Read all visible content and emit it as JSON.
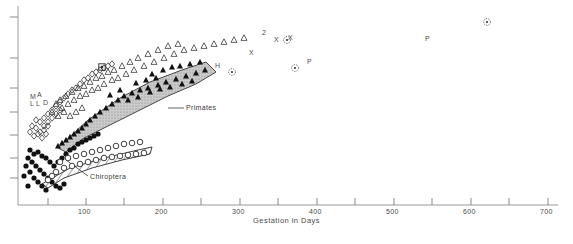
{
  "figure": {
    "type": "scatter",
    "background": "#ffffff",
    "axis_color": "#8a8a8a",
    "width": 573,
    "height": 244
  },
  "axes": {
    "x": {
      "label": "Gestation in Days",
      "min": 0,
      "max": 700,
      "plot_left_px": 18,
      "plot_right_px": 558,
      "major_ticks": [
        100,
        200,
        300,
        400,
        500,
        600,
        700
      ],
      "minor_ticks": [
        50,
        150,
        250,
        350,
        450,
        550,
        650
      ],
      "tick_labels": [
        "100",
        "200",
        "300",
        "400",
        "500",
        "600",
        "700"
      ],
      "scale": "linear",
      "grid": false
    },
    "y": {
      "label": "",
      "scale": "log",
      "tick_labels": [],
      "tick_px": [
        17,
        58,
        88,
        112,
        135,
        158,
        178
      ],
      "grid": false,
      "note": "unlabeled tick marks only"
    }
  },
  "annotations": {
    "primates": {
      "text": "Primates",
      "x_px": 186,
      "y_px": 108
    },
    "chiroptera": {
      "text": "Chiroptera",
      "x_px": 90,
      "y_px": 178
    },
    "cluster_letters": [
      {
        "text": "M",
        "x_px": 30,
        "y_px": 97
      },
      {
        "text": "A",
        "x_px": 37,
        "y_px": 95
      },
      {
        "text": "L",
        "x_px": 30,
        "y_px": 104
      },
      {
        "text": "L",
        "x_px": 36,
        "y_px": 104
      },
      {
        "text": "D",
        "x_px": 43,
        "y_px": 103
      }
    ],
    "outliers": [
      {
        "text": "H",
        "x_px": 215,
        "y_px": 66
      },
      {
        "text": "X",
        "x_px": 249,
        "y_px": 53
      },
      {
        "text": "X",
        "x_px": 274,
        "y_px": 40
      },
      {
        "text": "X",
        "x_px": 288,
        "y_px": 38
      },
      {
        "text": "P",
        "x_px": 307,
        "y_px": 62
      },
      {
        "text": "P",
        "x_px": 425,
        "y_px": 39
      },
      {
        "text": "2",
        "x_px": 262,
        "y_px": 33
      }
    ]
  },
  "regions": [
    {
      "name": "primates-polygon",
      "label": "Primates",
      "fill": "#b4b4b4",
      "stroke": "#2a2a2a",
      "pattern": "solid-gray"
    },
    {
      "name": "chiroptera-polygon",
      "label": "Chiroptera",
      "fill": "#ffffff",
      "stroke": "#2a2a2a",
      "pattern": "diagonal-hatch"
    }
  ],
  "chart_data": {
    "type": "scatter",
    "title": "",
    "xlabel": "Gestation in Days",
    "ylabel": "",
    "xlim": [
      0,
      700
    ],
    "ylim_scale": "log",
    "grid": false,
    "legend": "none",
    "annotations": [
      "Primates",
      "Chiroptera",
      "H",
      "X",
      "P",
      "M",
      "A",
      "L",
      "L",
      "D",
      "2"
    ],
    "series": [
      {
        "name": "Primates (filled triangle)",
        "marker": "filled-triangle",
        "color": "#111111",
        "points": [
          [
            152,
            74
          ],
          [
            163,
            70
          ],
          [
            172,
            67
          ],
          [
            180,
            66
          ],
          [
            190,
            64
          ],
          [
            200,
            62
          ],
          [
            205,
            70
          ],
          [
            196,
            73
          ],
          [
            186,
            76
          ],
          [
            176,
            79
          ],
          [
            166,
            82
          ],
          [
            158,
            85
          ],
          [
            148,
            88
          ],
          [
            140,
            90
          ],
          [
            132,
            93
          ],
          [
            124,
            96
          ],
          [
            118,
            100
          ],
          [
            112,
            104
          ],
          [
            106,
            108
          ],
          [
            100,
            112
          ],
          [
            95,
            116
          ],
          [
            90,
            120
          ],
          [
            86,
            124
          ],
          [
            82,
            128
          ],
          [
            78,
            131
          ],
          [
            74,
            134
          ],
          [
            70,
            137
          ],
          [
            66,
            140
          ],
          [
            62,
            143
          ],
          [
            58,
            146
          ],
          [
            136,
            83
          ],
          [
            146,
            80
          ],
          [
            156,
            78
          ],
          [
            120,
            90
          ],
          [
            110,
            95
          ],
          [
            128,
            100
          ],
          [
            138,
            97
          ],
          [
            150,
            92
          ],
          [
            160,
            89
          ],
          [
            170,
            87
          ],
          [
            182,
            84
          ],
          [
            192,
            81
          ]
        ]
      },
      {
        "name": "Open triangle",
        "marker": "open-triangle",
        "color": "#3a3a3a",
        "points": [
          [
            60,
            100
          ],
          [
            66,
            96
          ],
          [
            72,
            92
          ],
          [
            78,
            88
          ],
          [
            84,
            86
          ],
          [
            90,
            82
          ],
          [
            96,
            78
          ],
          [
            102,
            76
          ],
          [
            108,
            72
          ],
          [
            114,
            70
          ],
          [
            122,
            66
          ],
          [
            130,
            62
          ],
          [
            138,
            58
          ],
          [
            148,
            54
          ],
          [
            158,
            50
          ],
          [
            168,
            46
          ],
          [
            178,
            44
          ],
          [
            56,
            104
          ],
          [
            62,
            108
          ],
          [
            68,
            104
          ],
          [
            74,
            100
          ],
          [
            80,
            96
          ],
          [
            86,
            94
          ],
          [
            92,
            90
          ],
          [
            98,
            88
          ],
          [
            104,
            84
          ],
          [
            112,
            80
          ],
          [
            118,
            78
          ],
          [
            126,
            74
          ],
          [
            134,
            70
          ],
          [
            144,
            66
          ],
          [
            154,
            62
          ],
          [
            164,
            58
          ],
          [
            174,
            54
          ],
          [
            184,
            50
          ],
          [
            194,
            48
          ],
          [
            204,
            46
          ],
          [
            214,
            44
          ],
          [
            224,
            42
          ],
          [
            234,
            40
          ],
          [
            244,
            38
          ],
          [
            52,
            112
          ],
          [
            58,
            116
          ],
          [
            64,
            112
          ],
          [
            70,
            116
          ],
          [
            76,
            112
          ],
          [
            82,
            108
          ]
        ]
      },
      {
        "name": "Open diamond",
        "marker": "open-diamond",
        "color": "#3a3a3a",
        "points": [
          [
            44,
            118
          ],
          [
            48,
            114
          ],
          [
            52,
            110
          ],
          [
            56,
            106
          ],
          [
            60,
            102
          ],
          [
            64,
            98
          ],
          [
            40,
            122
          ],
          [
            44,
            126
          ],
          [
            48,
            122
          ],
          [
            52,
            118
          ],
          [
            56,
            114
          ],
          [
            60,
            110
          ],
          [
            36,
            128
          ],
          [
            40,
            132
          ],
          [
            44,
            130
          ],
          [
            48,
            126
          ],
          [
            36,
            120
          ],
          [
            32,
            126
          ],
          [
            68,
            94
          ],
          [
            72,
            90
          ],
          [
            76,
            88
          ],
          [
            80,
            84
          ],
          [
            84,
            80
          ],
          [
            88,
            78
          ],
          [
            92,
            74
          ],
          [
            96,
            72
          ],
          [
            100,
            70
          ],
          [
            104,
            68
          ],
          [
            108,
            66
          ],
          [
            112,
            64
          ],
          [
            30,
            132
          ],
          [
            34,
            136
          ],
          [
            38,
            134
          ],
          [
            42,
            138
          ],
          [
            46,
            134
          ]
        ]
      },
      {
        "name": "Filled circle",
        "marker": "filled-circle",
        "color": "#111111",
        "points": [
          [
            30,
            150
          ],
          [
            34,
            154
          ],
          [
            38,
            152
          ],
          [
            42,
            156
          ],
          [
            46,
            158
          ],
          [
            50,
            162
          ],
          [
            28,
            158
          ],
          [
            32,
            162
          ],
          [
            36,
            166
          ],
          [
            40,
            170
          ],
          [
            44,
            174
          ],
          [
            48,
            178
          ],
          [
            26,
            166
          ],
          [
            30,
            172
          ],
          [
            34,
            178
          ],
          [
            38,
            182
          ],
          [
            42,
            186
          ],
          [
            46,
            190
          ],
          [
            54,
            166
          ],
          [
            58,
            162
          ],
          [
            62,
            158
          ],
          [
            66,
            154
          ],
          [
            70,
            150
          ],
          [
            74,
            148
          ],
          [
            78,
            144
          ],
          [
            82,
            142
          ],
          [
            86,
            140
          ],
          [
            90,
            138
          ],
          [
            94,
            136
          ],
          [
            98,
            134
          ],
          [
            52,
            182
          ],
          [
            56,
            186
          ],
          [
            60,
            188
          ],
          [
            64,
            184
          ],
          [
            24,
            176
          ],
          [
            28,
            186
          ]
        ]
      },
      {
        "name": "Chiroptera (open circle)",
        "marker": "open-circle",
        "color": "#2a2a2a",
        "points": [
          [
            60,
            162
          ],
          [
            68,
            158
          ],
          [
            76,
            156
          ],
          [
            84,
            154
          ],
          [
            92,
            152
          ],
          [
            100,
            150
          ],
          [
            108,
            148
          ],
          [
            116,
            146
          ],
          [
            124,
            144
          ],
          [
            132,
            143
          ],
          [
            140,
            142
          ],
          [
            64,
            168
          ],
          [
            72,
            166
          ],
          [
            80,
            164
          ],
          [
            88,
            162
          ],
          [
            96,
            160
          ],
          [
            104,
            158
          ],
          [
            112,
            157
          ],
          [
            120,
            156
          ],
          [
            128,
            155
          ],
          [
            136,
            154
          ],
          [
            144,
            153
          ],
          [
            56,
            172
          ],
          [
            52,
            176
          ],
          [
            48,
            180
          ]
        ]
      },
      {
        "name": "Dotted circle outlier",
        "marker": "dotted-circle",
        "color": "#3a3a3a",
        "points": [
          [
            287,
            40
          ],
          [
            295,
            68
          ],
          [
            487,
            22
          ],
          [
            232,
            72
          ]
        ]
      },
      {
        "name": "Boxed marker",
        "marker": "boxed-square",
        "color": "#2a2a2a",
        "points": [
          [
            102,
            67
          ]
        ]
      }
    ]
  }
}
